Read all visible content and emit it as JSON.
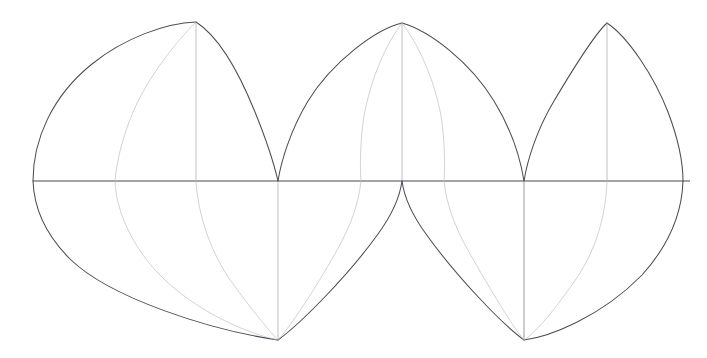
{
  "figure": {
    "background_color": "#ffffff",
    "width": 707,
    "height": 358,
    "outline_color": "#4c4c54",
    "meridian_color": "#9a9aa4",
    "faint_meridian_color": "#b6b6bf",
    "equator_color": "#4a4a52"
  },
  "chart_data": {
    "type": "line",
    "xlabel": "",
    "ylabel": "",
    "grid": false,
    "legend": null,
    "xlim": [
      0,
      707
    ],
    "ylim": [
      0,
      358
    ],
    "equator_y": 181,
    "lobe_count": 3,
    "apex_y": 22,
    "bottom_point_y": 340,
    "lobes": [
      {
        "name": "left-gore",
        "apex": [
          196,
          22
        ],
        "equator_left": [
          33,
          181
        ],
        "equator_right": [
          278,
          181
        ],
        "bottom_point": [
          278,
          340
        ],
        "upper_shape": "convex-leaf",
        "lower_shape": "tapered-wedge"
      },
      {
        "name": "middle-gore",
        "apex": [
          402,
          23
        ],
        "equator_left": [
          278,
          181
        ],
        "equator_right": [
          524,
          181
        ],
        "bottom_cusp": [
          402,
          181
        ],
        "bottom_points": [
          [
            278,
            340
          ],
          [
            524,
            340
          ]
        ],
        "upper_shape": "convex-leaf",
        "lower_shape": "split-inverted-wedge"
      },
      {
        "name": "right-gore",
        "apex": [
          607,
          23
        ],
        "equator_left": [
          524,
          181
        ],
        "equator_right": [
          683,
          181
        ],
        "bottom_point": [
          524,
          340
        ],
        "upper_shape": "convex-leaf",
        "lower_shape": "tapered-wedge"
      }
    ],
    "equator": {
      "x_start": 33,
      "x_end": 690,
      "y": 181
    },
    "meridians_at_equator_x": [
      115,
      196,
      278,
      361,
      402,
      444,
      524,
      607
    ]
  }
}
